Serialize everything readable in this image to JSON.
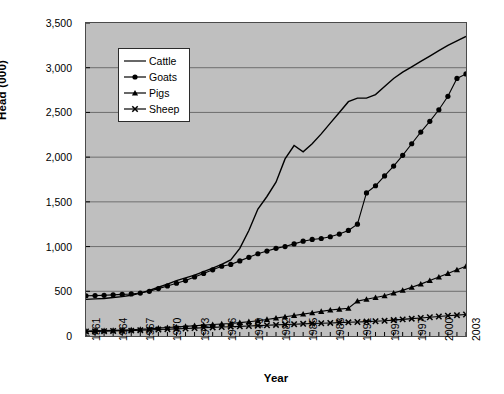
{
  "chart_data": {
    "type": "line",
    "title": "",
    "xlabel": "Year",
    "ylabel": "Head (000)",
    "xlim": [
      1961,
      2003
    ],
    "ylim": [
      0,
      3500
    ],
    "ytick_step": 500,
    "xtick_label_step": 3,
    "grid": true,
    "legend_position": "top-left-inside",
    "plot_background": "#bfbfbf",
    "series_color": "#000000",
    "yticks": [
      "0",
      "500",
      "1,000",
      "1,500",
      "2,000",
      "2,500",
      "3,000",
      "3,500"
    ],
    "x": [
      1961,
      1962,
      1963,
      1964,
      1965,
      1966,
      1967,
      1968,
      1969,
      1970,
      1971,
      1972,
      1973,
      1974,
      1975,
      1976,
      1977,
      1978,
      1979,
      1980,
      1981,
      1982,
      1983,
      1984,
      1985,
      1986,
      1987,
      1988,
      1989,
      1990,
      1991,
      1992,
      1993,
      1994,
      1995,
      1996,
      1997,
      1998,
      1999,
      2000,
      2001,
      2002,
      2003
    ],
    "xticks": [
      "1961",
      "1964",
      "1967",
      "1970",
      "1973",
      "1976",
      "1979",
      "1982",
      "1985",
      "1988",
      "1991",
      "1994",
      "1997",
      "2000",
      "2003"
    ],
    "series": [
      {
        "name": "Cattle",
        "marker": "none",
        "values": [
          410,
          415,
          420,
          430,
          440,
          455,
          480,
          510,
          545,
          580,
          620,
          650,
          680,
          720,
          760,
          800,
          850,
          980,
          1180,
          1420,
          1560,
          1720,
          1980,
          2130,
          2060,
          2150,
          2260,
          2380,
          2500,
          2620,
          2660,
          2660,
          2700,
          2790,
          2880,
          2950,
          3010,
          3070,
          3130,
          3190,
          3250,
          3300,
          3350
        ]
      },
      {
        "name": "Goats",
        "marker": "circle",
        "values": [
          450,
          452,
          455,
          460,
          465,
          470,
          480,
          500,
          530,
          560,
          590,
          620,
          660,
          700,
          740,
          780,
          800,
          840,
          880,
          920,
          950,
          980,
          1000,
          1030,
          1060,
          1080,
          1090,
          1110,
          1140,
          1180,
          1250,
          1600,
          1680,
          1790,
          1900,
          2020,
          2150,
          2280,
          2400,
          2530,
          2680,
          2880,
          2930
        ]
      },
      {
        "name": "Pigs",
        "marker": "triangle",
        "values": [
          55,
          58,
          60,
          63,
          66,
          70,
          75,
          80,
          88,
          95,
          100,
          108,
          115,
          122,
          128,
          135,
          140,
          150,
          160,
          170,
          185,
          200,
          215,
          230,
          245,
          260,
          275,
          290,
          300,
          310,
          390,
          410,
          430,
          450,
          480,
          510,
          545,
          580,
          620,
          660,
          700,
          740,
          780
        ]
      },
      {
        "name": "Sheep",
        "marker": "cross",
        "values": [
          50,
          52,
          54,
          56,
          58,
          60,
          64,
          68,
          72,
          76,
          80,
          84,
          88,
          92,
          96,
          100,
          104,
          108,
          112,
          116,
          120,
          124,
          128,
          132,
          136,
          140,
          143,
          146,
          150,
          153,
          157,
          161,
          165,
          170,
          178,
          186,
          194,
          202,
          210,
          218,
          226,
          233,
          240
        ]
      }
    ]
  },
  "legend": {
    "items": [
      {
        "label": "Cattle"
      },
      {
        "label": "Goats"
      },
      {
        "label": "Pigs"
      },
      {
        "label": "Sheep"
      }
    ]
  },
  "axes": {
    "x_title": "Year",
    "y_title": "Head (000)"
  }
}
